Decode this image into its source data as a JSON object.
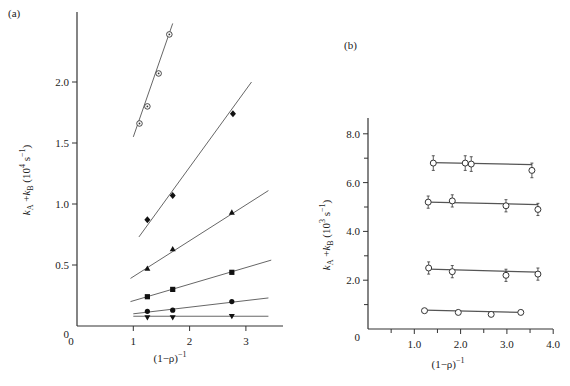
{
  "chart_data": [
    {
      "panel": "(a)",
      "type": "scatter",
      "xlabel": "(1-ρ)^-1",
      "ylabel": "k_A + k_B (10^4 s^-1)",
      "xlim": [
        0,
        3.6
      ],
      "ylim": [
        0,
        2.5
      ],
      "x_ticks": [
        0,
        1,
        2,
        3
      ],
      "x_tick_labels": [
        "0",
        "1",
        "2",
        "3"
      ],
      "y_ticks": [
        0,
        0.5,
        1.0,
        1.5,
        2.0
      ],
      "y_tick_labels": [
        "0",
        "0.5",
        "1.0",
        "1.5",
        "2.0"
      ],
      "grid": false,
      "series": [
        {
          "name": "dotted-circle",
          "marker": "circle-dot",
          "x": [
            1.11,
            1.25,
            1.45,
            1.64
          ],
          "y": [
            1.66,
            1.8,
            2.07,
            2.39
          ],
          "fit": [
            [
              1.0,
              1.55
            ],
            [
              1.7,
              2.48
            ]
          ]
        },
        {
          "name": "diamond",
          "marker": "diamond",
          "x": [
            1.25,
            1.7,
            2.77
          ],
          "y": [
            0.87,
            1.07,
            1.74
          ],
          "fit": [
            [
              1.1,
              0.73
            ],
            [
              3.1,
              2.0
            ]
          ]
        },
        {
          "name": "triangle-up",
          "marker": "triangle-up",
          "x": [
            1.25,
            1.7,
            2.75
          ],
          "y": [
            0.47,
            0.63,
            0.93
          ],
          "fit": [
            [
              0.95,
              0.39
            ],
            [
              3.4,
              1.11
            ]
          ]
        },
        {
          "name": "square",
          "marker": "square",
          "x": [
            1.25,
            1.7,
            2.75
          ],
          "y": [
            0.24,
            0.3,
            0.44
          ],
          "fit": [
            [
              0.95,
              0.2
            ],
            [
              3.45,
              0.54
            ]
          ]
        },
        {
          "name": "filled-circle",
          "marker": "circle",
          "x": [
            1.25,
            1.7,
            2.75
          ],
          "y": [
            0.12,
            0.13,
            0.2
          ],
          "fit": [
            [
              1.0,
              0.1
            ],
            [
              3.4,
              0.23
            ]
          ]
        },
        {
          "name": "triangle-down",
          "marker": "triangle-down",
          "x": [
            1.25,
            1.7,
            2.75
          ],
          "y": [
            0.07,
            0.07,
            0.08
          ],
          "fit": [
            [
              1.0,
              0.08
            ],
            [
              3.4,
              0.08
            ]
          ]
        }
      ]
    },
    {
      "panel": "(b)",
      "type": "scatter",
      "xlabel": "(1-ρ)^-1",
      "ylabel": "k_A + k_B (10^3 s^-1)",
      "xlim": [
        0,
        4.0
      ],
      "ylim": [
        0,
        8.8
      ],
      "x_ticks": [
        1.0,
        2.0,
        3.0,
        4.0
      ],
      "x_tick_labels": [
        "1.0",
        "2.0",
        "3.0",
        "4.0"
      ],
      "y_ticks": [
        0,
        2.0,
        4.0,
        6.0,
        8.0
      ],
      "y_tick_labels": [
        "0",
        "2.0",
        "4.0",
        "6.0",
        "8.0"
      ],
      "grid": false,
      "error_bars": true,
      "series": [
        {
          "name": "series-1",
          "marker": "open-circle",
          "x": [
            1.41,
            2.1,
            2.23,
            3.54
          ],
          "y": [
            6.8,
            6.8,
            6.76,
            6.5
          ],
          "err": 0.3,
          "fit": [
            [
              1.41,
              6.82
            ],
            [
              3.54,
              6.74
            ]
          ]
        },
        {
          "name": "series-2",
          "marker": "open-circle",
          "x": [
            1.3,
            1.82,
            2.98,
            3.67
          ],
          "y": [
            5.2,
            5.25,
            5.05,
            4.9
          ],
          "err": 0.25,
          "fit": [
            [
              1.3,
              5.2
            ],
            [
              3.67,
              5.1
            ]
          ]
        },
        {
          "name": "series-3",
          "marker": "open-circle",
          "x": [
            1.31,
            1.82,
            2.98,
            3.67
          ],
          "y": [
            2.5,
            2.35,
            2.2,
            2.25
          ],
          "err": 0.25,
          "fit": [
            [
              1.31,
              2.45
            ],
            [
              3.67,
              2.33
            ]
          ]
        },
        {
          "name": "series-4",
          "marker": "open-circle",
          "x": [
            1.22,
            1.95,
            2.66,
            3.3
          ],
          "y": [
            0.75,
            0.68,
            0.6,
            0.68
          ],
          "err": 0,
          "fit": [
            [
              1.22,
              0.77
            ],
            [
              3.3,
              0.68
            ]
          ]
        }
      ]
    }
  ],
  "labels": {
    "panel_a": "(a)",
    "panel_b": "(b)",
    "x_axis_a": "(1−ρ)",
    "x_axis_b": "(1−ρ)",
    "x_axis_exp": "−1",
    "y_axis_a_main": "k",
    "y_axis_b_main": "k",
    "y_axis_a_text": "+k",
    "y_axis_a_units": "(10",
    "y_axis_a_pow": "4",
    "y_axis_a_tail": "s",
    "y_axis_b_pow": "3"
  }
}
